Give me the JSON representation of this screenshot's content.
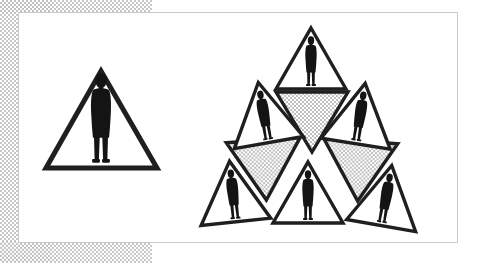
{
  "canvas": {
    "width": 483,
    "height": 263,
    "background_color": "#ffffff"
  },
  "background_band": {
    "name": "halftone-gray-band",
    "pattern": "checkered-dither",
    "color": "#bfbfbf",
    "base_color": "#ffffff"
  },
  "panel": {
    "name": "white-figure-panel",
    "fill_color": "#ffffff",
    "border_color": "#c9c9c9",
    "x": 18,
    "y": 12,
    "width": 440,
    "height": 231
  },
  "figure": {
    "title": "Triangle Subdivision with Human Figures",
    "stroke_color": "#1a1a1a",
    "fill_white": "#ffffff",
    "fill_gray": "#d4d4d4",
    "silhouette_color": "#111111",
    "left_shape": {
      "name": "large-triangle",
      "label": "Large triangle with single figure",
      "orientation": "up",
      "fill": "#ffffff",
      "stroke_width": 5,
      "apex_x": 101,
      "apex_y": 71,
      "base_left_x": 49,
      "base_right_x": 157,
      "base_y": 168,
      "figure_count": 1
    },
    "right_cluster": {
      "name": "exploded-sierpinski-cluster",
      "label": "Exploded subdivision: six up-triangles with figures, three gray down-triangles",
      "up_triangle_count": 6,
      "down_triangle_count": 3,
      "up_triangles": [
        {
          "id": "top",
          "label": "top up-triangle",
          "cx": 311,
          "cy": 57,
          "size": 58,
          "rotation": 0,
          "fill": "#ffffff",
          "has_figure": true
        },
        {
          "id": "upper-left",
          "label": "upper-left up-triangle",
          "cx": 265,
          "cy": 113,
          "size": 57,
          "rotation": -9,
          "fill": "#ffffff",
          "has_figure": true
        },
        {
          "id": "upper-right",
          "label": "upper-right up-triangle",
          "cx": 359,
          "cy": 114,
          "size": 57,
          "rotation": 8,
          "fill": "#ffffff",
          "has_figure": true
        },
        {
          "id": "bottom-left",
          "label": "bottom-left up-triangle",
          "cx": 233,
          "cy": 192,
          "size": 57,
          "rotation": -6,
          "fill": "#ffffff",
          "has_figure": true
        },
        {
          "id": "bottom-center",
          "label": "bottom-center up-triangle",
          "cx": 308,
          "cy": 193,
          "size": 58,
          "rotation": 0,
          "fill": "#ffffff",
          "has_figure": true
        },
        {
          "id": "bottom-right",
          "label": "bottom-right up-triangle",
          "cx": 385,
          "cy": 196,
          "size": 57,
          "rotation": 9,
          "fill": "#ffffff",
          "has_figure": true
        }
      ],
      "down_triangles": [
        {
          "id": "center-top",
          "label": "upper gray down-triangle",
          "cx": 312,
          "cy": 119,
          "size": 58,
          "rotation": 0,
          "fill": "#d4d4d4",
          "has_figure": false
        },
        {
          "id": "center-left",
          "label": "left gray down-triangle",
          "cx": 268,
          "cy": 165,
          "size": 58,
          "rotation": -4,
          "fill": "#d4d4d4",
          "has_figure": false
        },
        {
          "id": "center-right",
          "label": "right gray down-triangle",
          "cx": 357,
          "cy": 166,
          "size": 58,
          "rotation": 4,
          "fill": "#d4d4d4",
          "has_figure": false
        }
      ]
    }
  }
}
